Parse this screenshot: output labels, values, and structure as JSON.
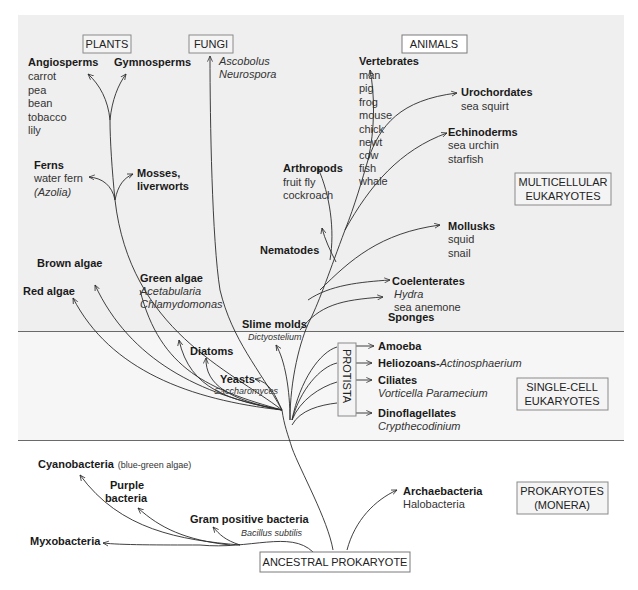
{
  "categories": {
    "plants": "PLANTS",
    "fungi": "FUNGI",
    "animals": "ANIMALS",
    "protista": "PROTISTA",
    "ancestral": "ANCESTRAL PROKARYOTE"
  },
  "regions": {
    "multicellular": [
      "MULTICELLULAR",
      "EUKARYOTES"
    ],
    "single_cell": [
      "SINGLE-CELL",
      "EUKARYOTES"
    ],
    "prokaryotes": [
      "PROKARYOTES",
      "(MONERA)"
    ]
  },
  "plants": {
    "angiosperms": {
      "title": "Angiosperms",
      "examples": [
        "carrot",
        "pea",
        "bean",
        "tobacco",
        "lily"
      ]
    },
    "gymnosperms": {
      "title": "Gymnosperms"
    },
    "ferns": {
      "title": "Ferns",
      "examples": [
        "water fern",
        "(Azolia)"
      ]
    },
    "mosses": {
      "title": [
        "Mosses,",
        "liverworts"
      ]
    }
  },
  "fungi": {
    "examples": [
      "Ascobolus",
      "Neurospora"
    ]
  },
  "animals": {
    "vertebrates": {
      "title": "Vertebrates",
      "examples": [
        "man",
        "pig",
        "frog",
        "mouse",
        "chick",
        "newt",
        "cow",
        "fish",
        "whale"
      ]
    },
    "urochordates": {
      "title": "Urochordates",
      "examples": [
        "sea squirt"
      ]
    },
    "echinoderms": {
      "title": "Echinoderms",
      "examples": [
        "sea urchin",
        "starfish"
      ]
    },
    "arthropods": {
      "title": "Arthropods",
      "examples": [
        "fruit fly",
        "cockroach"
      ]
    },
    "mollusks": {
      "title": "Mollusks",
      "examples": [
        "squid",
        "snail"
      ]
    },
    "nematodes": {
      "title": "Nematodes"
    },
    "coelenterates": {
      "title": "Coelenterates",
      "examples": [
        "Hydra",
        "sea anemone"
      ]
    },
    "sponges": {
      "title": "Sponges"
    }
  },
  "algae": {
    "brown": "Brown algae",
    "red": "Red algae",
    "green": {
      "title": "Green algae",
      "examples": [
        "Acetabularia",
        "Chlamydomonas"
      ]
    }
  },
  "protists": {
    "slime_molds": {
      "title": "Slime molds",
      "example": "Dictyostelium"
    },
    "diatoms": "Diatoms",
    "yeasts": {
      "title": "Yeasts",
      "example": "Saccharomyces"
    },
    "amoeba": "Amoeba",
    "heliozoans": {
      "title": "Heliozoans-",
      "example": "Actinosphaerium"
    },
    "ciliates": {
      "title": "Ciliates",
      "example": "Vorticella Paramecium"
    },
    "dinoflagellates": {
      "title": "Dinoflagellates",
      "example": "Crypthecodinium"
    }
  },
  "prokaryotes": {
    "cyanobacteria": {
      "title": "Cyanobacteria",
      "note": "(blue-green algae)"
    },
    "purple": {
      "title": [
        "Purple",
        "bacteria"
      ]
    },
    "gram_positive": {
      "title": "Gram positive bacteria",
      "example": "Bacillus subtilis"
    },
    "myxobacteria": "Myxobacteria",
    "archaebacteria": {
      "title": "Archaebacteria",
      "example": "Halobacteria"
    }
  }
}
